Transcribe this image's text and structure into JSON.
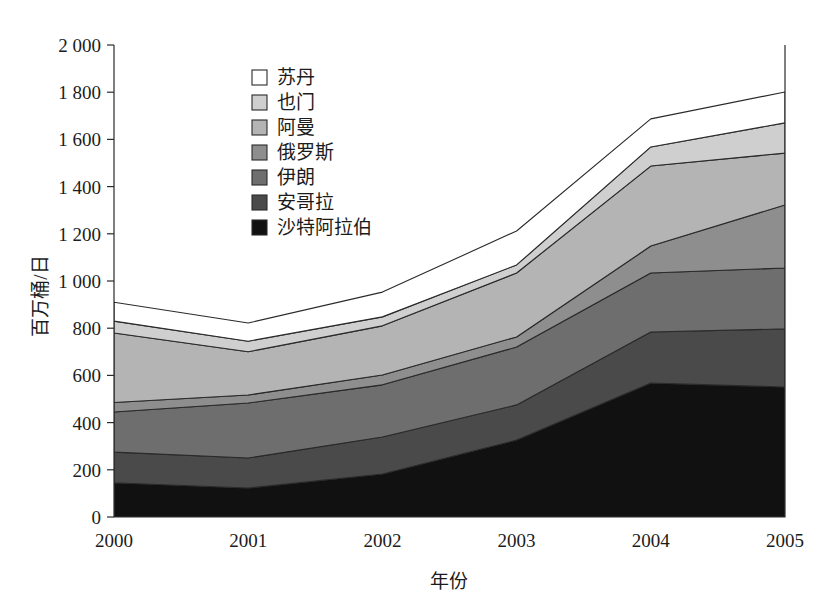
{
  "chart_data": {
    "type": "area",
    "title": "",
    "subtitle": "",
    "xlabel": "年份",
    "ylabel": "百万桶/日",
    "categories": [
      "2000",
      "2001",
      "2002",
      "2003",
      "2004",
      "2005"
    ],
    "x": [
      2000,
      2001,
      2002,
      2003,
      2004,
      2005
    ],
    "xlim": [
      2000,
      2005
    ],
    "ylim": [
      0,
      2000
    ],
    "ytick_labels": [
      "0",
      "200",
      "400",
      "600",
      "800",
      "1 000",
      "1 200",
      "1 400",
      "1 600",
      "1 800",
      "2 000"
    ],
    "ytick_values": [
      0,
      200,
      400,
      600,
      800,
      1000,
      1200,
      1400,
      1600,
      1800,
      2000
    ],
    "ytick_step": 200,
    "xtick_labels": [
      "2000",
      "2001",
      "2002",
      "2003",
      "2004",
      "2005"
    ],
    "grid": false,
    "stacked": true,
    "legend_position": "inside-upper-left",
    "legend_order_top_to_bottom": [
      "苏丹",
      "也门",
      "阿曼",
      "俄罗斯",
      "伊朗",
      "安哥拉",
      "沙特阿拉伯"
    ],
    "series": [
      {
        "name": "沙特阿拉伯",
        "color": "#111111",
        "values": [
          145,
          123,
          182,
          326,
          568,
          551
        ]
      },
      {
        "name": "安哥拉",
        "color": "#4a4a4a",
        "values": [
          130,
          127,
          157,
          149,
          216,
          246
        ]
      },
      {
        "name": "伊朗",
        "color": "#6e6e6e",
        "values": [
          170,
          233,
          221,
          245,
          250,
          258
        ]
      },
      {
        "name": "俄罗斯",
        "color": "#8e8e8e",
        "values": [
          40,
          34,
          42,
          43,
          114,
          267
        ]
      },
      {
        "name": "阿曼",
        "color": "#b4b4b4",
        "values": [
          295,
          183,
          208,
          271,
          339,
          220
        ]
      },
      {
        "name": "也门",
        "color": "#cfcfcf",
        "values": [
          50,
          45,
          38,
          34,
          81,
          128
        ]
      },
      {
        "name": "苏丹",
        "color": "#ffffff",
        "values": [
          80,
          77,
          105,
          144,
          119,
          131
        ]
      }
    ],
    "stack_totals": [
      910,
      822,
      953,
      1212,
      1687,
      1801
    ],
    "cumulative_top_boundaries": {
      "沙特阿拉伯": [
        145,
        123,
        182,
        326,
        568,
        551
      ],
      "安哥拉": [
        275,
        250,
        339,
        475,
        784,
        797
      ],
      "伊朗": [
        445,
        483,
        560,
        720,
        1034,
        1055
      ],
      "俄罗斯": [
        485,
        517,
        602,
        763,
        1148,
        1322
      ],
      "阿曼": [
        780,
        700,
        810,
        1034,
        1487,
        1542
      ],
      "也门": [
        830,
        745,
        848,
        1068,
        1568,
        1670
      ],
      "苏丹": [
        910,
        822,
        953,
        1212,
        1687,
        1801
      ]
    }
  },
  "legend": {
    "items": [
      {
        "label": "苏丹",
        "color": "#ffffff"
      },
      {
        "label": "也门",
        "color": "#cfcfcf"
      },
      {
        "label": "阿曼",
        "color": "#b4b4b4"
      },
      {
        "label": "俄罗斯",
        "color": "#8e8e8e"
      },
      {
        "label": "伊朗",
        "color": "#6e6e6e"
      },
      {
        "label": "安哥拉",
        "color": "#4a4a4a"
      },
      {
        "label": "沙特阿拉伯",
        "color": "#111111"
      }
    ]
  },
  "axes": {
    "y_title": "百万桶/日",
    "x_title": "年份",
    "y_labels": [
      "2 000",
      "1 800",
      "1 600",
      "1 400",
      "1 200",
      "1 000",
      "800",
      "600",
      "400",
      "200",
      "0"
    ],
    "x_labels": [
      "2000",
      "2001",
      "2002",
      "2003",
      "2004",
      "2005"
    ]
  }
}
